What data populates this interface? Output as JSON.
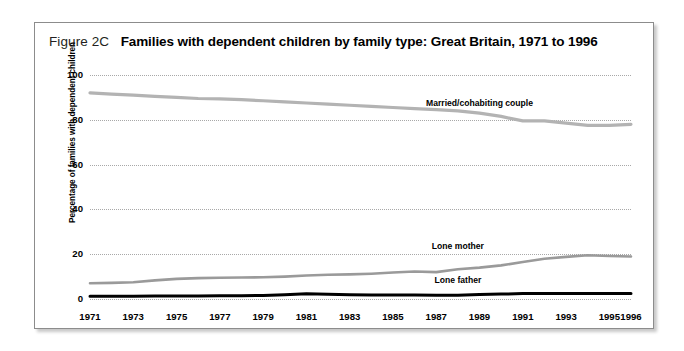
{
  "figure": {
    "number": "Figure 2C",
    "title": "Families with dependent children by family type: Great Britain, 1971 to 1996"
  },
  "chart_data": {
    "type": "line",
    "title": "Families with dependent children by family type: Great Britain, 1971 to 1996",
    "xlabel": "",
    "ylabel": "Percentage of families with dependent children",
    "ylim": [
      0,
      100
    ],
    "yticks": [
      0,
      20,
      40,
      60,
      80,
      100
    ],
    "xlim": [
      1971,
      1996
    ],
    "xticks": [
      1971,
      1973,
      1975,
      1977,
      1979,
      1981,
      1983,
      1985,
      1987,
      1989,
      1991,
      1993,
      1995,
      1996
    ],
    "grid": true,
    "legend_position": "inline-labels",
    "x": [
      1971,
      1972,
      1973,
      1974,
      1975,
      1976,
      1977,
      1978,
      1979,
      1980,
      1981,
      1982,
      1983,
      1984,
      1985,
      1986,
      1987,
      1988,
      1989,
      1990,
      1991,
      1992,
      1993,
      1994,
      1995,
      1996
    ],
    "series": [
      {
        "name": "Married/cohabiting couple",
        "color": "#b3b3b3",
        "values": [
          92,
          91.5,
          91,
          90.5,
          90,
          89.5,
          89.3,
          89,
          88.5,
          88,
          87.5,
          87,
          86.5,
          86,
          85.5,
          85,
          84.5,
          84,
          83,
          81.5,
          79.5,
          79.5,
          78.5,
          77.5,
          77.5,
          78
        ]
      },
      {
        "name": "Lone mother",
        "color": "#9a9a9a",
        "values": [
          7,
          7.2,
          7.5,
          8.3,
          9,
          9.3,
          9.5,
          9.6,
          9.7,
          10,
          10.5,
          10.8,
          11,
          11.3,
          11.8,
          12.3,
          12,
          13.3,
          14,
          15,
          16.5,
          18,
          18.8,
          19.5,
          19.2,
          19
        ]
      },
      {
        "name": "Lone father",
        "color": "#000000",
        "values": [
          1.2,
          1.2,
          1.2,
          1.3,
          1.3,
          1.3,
          1.4,
          1.5,
          1.6,
          1.9,
          2.3,
          2.1,
          1.9,
          1.8,
          1.8,
          1.8,
          1.7,
          1.7,
          2.0,
          2.2,
          2.4,
          2.5,
          2.5,
          2.5,
          2.5,
          2.5
        ]
      }
    ],
    "annotations": [
      {
        "text": "Married/cohabiting couple",
        "x": 1989,
        "y": 87
      },
      {
        "text": "Lone mother",
        "x": 1988,
        "y": 23
      },
      {
        "text": "Lone father",
        "x": 1988,
        "y": 8
      }
    ]
  }
}
